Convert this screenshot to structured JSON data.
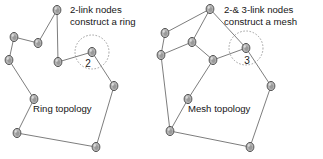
{
  "figure": {
    "type": "network-topology-diagram",
    "background_color": "#ffffff",
    "node_fill": "#b4b4b4",
    "node_stroke": "#4a4a4a",
    "edge_color": "#6e6e6e",
    "text_color": "#161616"
  },
  "left_panel": {
    "name": "ring-topology-panel",
    "caption": "Ring topology",
    "caption_pos": {
      "x": 33,
      "y": 112
    },
    "callout": {
      "line1": "2-link nodes",
      "line2": "construct a ring",
      "pos": {
        "x": 70,
        "y": 13
      }
    },
    "highlight": {
      "label": "2",
      "label_pos": {
        "x": 88,
        "y": 67
      },
      "circle": {
        "cx": 92,
        "cy": 52,
        "r": 17
      }
    },
    "nodes": [
      {
        "id": "L0",
        "x": 57,
        "y": 10,
        "links": 2
      },
      {
        "id": "L1",
        "x": 38,
        "y": 43,
        "links": 2
      },
      {
        "id": "L2",
        "x": 14,
        "y": 37,
        "links": 2
      },
      {
        "id": "L3",
        "x": 9,
        "y": 60,
        "links": 2
      },
      {
        "id": "L4",
        "x": 34,
        "y": 99,
        "links": 2
      },
      {
        "id": "L5",
        "x": 17,
        "y": 133,
        "links": 2
      },
      {
        "id": "L6",
        "x": 96,
        "y": 147,
        "links": 2
      },
      {
        "id": "L7",
        "x": 114,
        "y": 86,
        "links": 2
      },
      {
        "id": "L8",
        "x": 92,
        "y": 52,
        "links": 2
      },
      {
        "id": "L9",
        "x": 58,
        "y": 62,
        "links": 2
      }
    ],
    "edges": [
      [
        "L0",
        "L1"
      ],
      [
        "L1",
        "L2"
      ],
      [
        "L2",
        "L3"
      ],
      [
        "L3",
        "L4"
      ],
      [
        "L4",
        "L5"
      ],
      [
        "L5",
        "L6"
      ],
      [
        "L6",
        "L7"
      ],
      [
        "L7",
        "L8"
      ],
      [
        "L8",
        "L9"
      ],
      [
        "L9",
        "L0"
      ]
    ]
  },
  "right_panel": {
    "name": "mesh-topology-panel",
    "caption": "Mesh topology",
    "caption_pos": {
      "x": 188,
      "y": 112
    },
    "callout": {
      "line1": "2-& 3-link nodes",
      "line2": "construct a mesh",
      "pos": {
        "x": 224,
        "y": 13
      }
    },
    "highlight": {
      "label": "3",
      "label_pos": {
        "x": 247,
        "y": 64
      },
      "circle": {
        "cx": 246,
        "cy": 48,
        "r": 17
      }
    },
    "nodes": [
      {
        "id": "R0",
        "x": 210,
        "y": 9,
        "links": 3
      },
      {
        "id": "R1",
        "x": 165,
        "y": 33,
        "links": 2
      },
      {
        "id": "R2",
        "x": 192,
        "y": 42,
        "links": 3
      },
      {
        "id": "R3",
        "x": 161,
        "y": 55,
        "links": 3
      },
      {
        "id": "R4",
        "x": 213,
        "y": 60,
        "links": 3
      },
      {
        "id": "R5",
        "x": 246,
        "y": 48,
        "links": 3
      },
      {
        "id": "R6",
        "x": 271,
        "y": 86,
        "links": 2
      },
      {
        "id": "R7",
        "x": 250,
        "y": 147,
        "links": 2
      },
      {
        "id": "R8",
        "x": 170,
        "y": 131,
        "links": 3
      },
      {
        "id": "R9",
        "x": 188,
        "y": 99,
        "links": 2
      }
    ],
    "edges": [
      [
        "R0",
        "R1"
      ],
      [
        "R1",
        "R3"
      ],
      [
        "R0",
        "R2"
      ],
      [
        "R2",
        "R3"
      ],
      [
        "R2",
        "R4"
      ],
      [
        "R0",
        "R5"
      ],
      [
        "R4",
        "R5"
      ],
      [
        "R5",
        "R6"
      ],
      [
        "R6",
        "R7"
      ],
      [
        "R7",
        "R8"
      ],
      [
        "R8",
        "R3"
      ],
      [
        "R8",
        "R9"
      ],
      [
        "R9",
        "R4"
      ]
    ]
  }
}
